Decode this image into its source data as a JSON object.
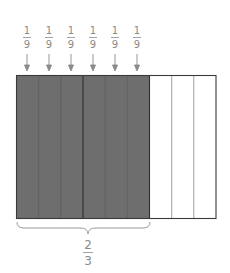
{
  "diagram": {
    "unit_fraction_labels": [
      {
        "numerator": "1",
        "denominator": "9"
      },
      {
        "numerator": "1",
        "denominator": "9"
      },
      {
        "numerator": "1",
        "denominator": "9"
      },
      {
        "numerator": "1",
        "denominator": "9"
      },
      {
        "numerator": "1",
        "denominator": "9"
      },
      {
        "numerator": "1",
        "denominator": "9"
      }
    ],
    "total_parts": 9,
    "shaded_parts": 6,
    "group_divisions": 3,
    "brace_label": {
      "numerator": "2",
      "denominator": "3"
    },
    "colors": {
      "shaded": "#6e6e6e",
      "unshaded": "#ffffff",
      "outline": "#3a3a3a",
      "thin_divider": "#9a9a9a",
      "label": "#8a8a8a"
    }
  }
}
